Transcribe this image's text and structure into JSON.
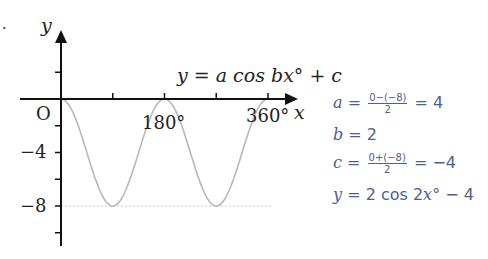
{
  "page": {
    "bullet": "."
  },
  "chart_data": {
    "type": "line",
    "title": "y = a cos bx° + c",
    "xlabel": "x",
    "ylabel": "y",
    "origin_label": "O",
    "x_tick_labels": [
      "180°",
      "360°"
    ],
    "y_tick_labels": [
      "−4",
      "−8"
    ],
    "x_ticks_deg": [
      90,
      180,
      270,
      360
    ],
    "y_ticks": [
      2,
      -2,
      -4,
      -6,
      -8,
      -10
    ],
    "xlim": [
      0,
      400
    ],
    "ylim": [
      -11,
      5
    ],
    "grid": false,
    "reference_line": {
      "y": -8,
      "style": "dotted"
    },
    "series": [
      {
        "name": "y = 2cos(2x°) − 4",
        "x": [
          0,
          45,
          90,
          135,
          180,
          225,
          270,
          315,
          360
        ],
        "values": [
          0,
          -4,
          -8,
          -4,
          0,
          -4,
          -8,
          -4,
          0
        ]
      }
    ],
    "curve_color": "#b8b8b8",
    "axis_color": "#111111"
  },
  "solution": {
    "color": "#4a5f94",
    "lines": [
      {
        "var": "a",
        "eq": "=",
        "frac_num": "0−(−8)",
        "frac_den": "2",
        "result": "= 4"
      },
      {
        "var": "b",
        "eq": "= 2"
      },
      {
        "var": "c",
        "eq": "=",
        "frac_num": "0+(−8)",
        "frac_den": "2",
        "result": "= −4"
      },
      {
        "var": "y",
        "eq": "= 2 cos 2",
        "var2": "x",
        "tail": "° − 4"
      }
    ]
  }
}
